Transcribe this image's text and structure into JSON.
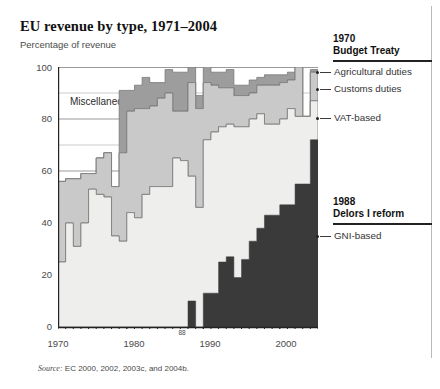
{
  "figure": {
    "title": "EU revenue by type, 1971–2004",
    "subtitle": "Percentage of revenue",
    "source": "Source:",
    "source_rest": " EC 2000, 2002, 2003c, and 2004b.",
    "inline_label_miscellaneous": "Miscellaneous"
  },
  "legend": {
    "group_top": {
      "year": "1970",
      "event": "Budget Treaty",
      "items": [
        {
          "label": "Agricultural duties",
          "color": "#9d9d9d"
        },
        {
          "label": "Customs duties",
          "color": "#c9c9c9"
        },
        {
          "label": "VAT-based",
          "color": "#eeeeec"
        }
      ]
    },
    "group_bottom": {
      "year": "1988",
      "event": "Delors I reform",
      "items": [
        {
          "label": "GNI-based",
          "color": "#3a3a3a"
        }
      ]
    }
  },
  "chart_data": {
    "type": "area",
    "stacked": true,
    "title": "EU revenue by type, 1971–2004",
    "subtitle": "Percentage of revenue",
    "xlabel": "",
    "ylabel": "Percentage of revenue",
    "xlim": [
      1971,
      2005
    ],
    "ylim": [
      0,
      100
    ],
    "yticks": [
      0,
      20,
      40,
      60,
      80,
      100
    ],
    "ytick_labels": [
      "0",
      "20",
      "40",
      "60",
      "80",
      "100"
    ],
    "xticks": [
      1970,
      1980,
      1990,
      2000
    ],
    "xtick_labels": [
      "1970",
      "1980",
      "1990",
      "2000"
    ],
    "x_annotation": {
      "label": "88",
      "value": 1988
    },
    "grid": "horizontal-major-and-minor",
    "legend_position": "right",
    "annotations": [
      {
        "text": "Miscellaneous",
        "x": 1976,
        "y": 84
      },
      {
        "text": "1970 Budget Treaty",
        "x": 2006,
        "y": 100
      },
      {
        "text": "1988 Delors I reform",
        "x": 2006,
        "y": 44
      }
    ],
    "x": [
      1971,
      1972,
      1973,
      1974,
      1975,
      1976,
      1977,
      1978,
      1979,
      1980,
      1981,
      1982,
      1983,
      1984,
      1985,
      1986,
      1987,
      1988,
      1989,
      1990,
      1991,
      1992,
      1993,
      1994,
      1995,
      1996,
      1997,
      1998,
      1999,
      2000,
      2001,
      2002,
      2003,
      2004
    ],
    "series": [
      {
        "name": "GNI-based",
        "color": "#3a3a3a",
        "order": 1,
        "values": [
          0,
          0,
          0,
          0,
          0,
          0,
          0,
          0,
          0,
          0,
          0,
          0,
          0,
          0,
          0,
          0,
          0,
          10,
          0,
          13,
          13,
          25,
          27,
          19,
          26,
          33,
          38,
          43,
          43,
          47,
          47,
          55,
          55,
          72
        ]
      },
      {
        "name": "VAT-based",
        "color": "#eeeeec",
        "order": 2,
        "values": [
          25,
          40,
          31,
          40,
          53,
          51,
          50,
          35,
          33,
          44,
          42,
          51,
          54,
          54,
          54,
          65,
          64,
          48,
          46,
          59,
          62,
          52,
          51,
          58,
          51,
          47,
          44,
          35,
          35,
          33,
          37,
          26,
          26,
          15
        ]
      },
      {
        "name": "Customs duties",
        "color": "#c9c9c9",
        "order": 3,
        "values": [
          31,
          17,
          26,
          19,
          6,
          14,
          17,
          19,
          34,
          39,
          42,
          33,
          31,
          34,
          36,
          18,
          19,
          36,
          38,
          22,
          18,
          15,
          14,
          12,
          12,
          10,
          11,
          15,
          15,
          14,
          11,
          19,
          0,
          11
        ]
      },
      {
        "name": "Agricultural duties",
        "color": "#9d9d9d",
        "order": 4,
        "values": [
          0,
          0,
          0,
          0,
          0,
          0,
          0,
          0,
          24,
          8,
          9,
          12,
          9,
          6,
          9,
          15,
          15,
          6,
          5,
          8,
          5,
          6,
          7,
          4,
          4,
          5,
          3,
          4,
          4,
          3,
          3,
          0,
          0,
          1
        ]
      }
    ],
    "cumulative_tops": {
      "gni": [
        0,
        0,
        0,
        0,
        0,
        0,
        0,
        0,
        0,
        0,
        0,
        0,
        0,
        0,
        0,
        0,
        0,
        10,
        0,
        13,
        13,
        25,
        27,
        19,
        26,
        33,
        38,
        43,
        43,
        47,
        47,
        55,
        55,
        72
      ],
      "vat": [
        25,
        40,
        31,
        40,
        53,
        51,
        50,
        35,
        33,
        44,
        42,
        51,
        54,
        54,
        54,
        65,
        64,
        58,
        46,
        72,
        75,
        77,
        78,
        77,
        77,
        80,
        82,
        78,
        78,
        80,
        84,
        81,
        81,
        87
      ],
      "customs": [
        56,
        57,
        57,
        59,
        59,
        65,
        67,
        54,
        67,
        83,
        84,
        84,
        85,
        88,
        90,
        83,
        83,
        94,
        84,
        94,
        93,
        92,
        92,
        89,
        89,
        90,
        93,
        93,
        93,
        94,
        95,
        100,
        81,
        98
      ],
      "agri": [
        56,
        57,
        57,
        59,
        59,
        65,
        67,
        54,
        91,
        91,
        93,
        96,
        94,
        94,
        99,
        98,
        98,
        100,
        89,
        102,
        98,
        98,
        99,
        93,
        93,
        95,
        96,
        97,
        97,
        97,
        98,
        100,
        81,
        99
      ]
    }
  }
}
